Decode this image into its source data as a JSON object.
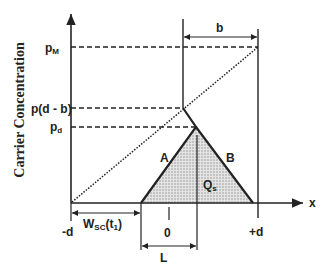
{
  "diagram": {
    "y_axis_label": "Carrier Concentration",
    "x_axis_label": "x",
    "y_ticks": {
      "pM": {
        "main": "p",
        "sub": "M"
      },
      "pdb": "p(d - b)",
      "pd": {
        "main": "p",
        "sub": "d"
      }
    },
    "x_ticks": {
      "neg_d": "-d",
      "zero": "0",
      "pos_d": "+d"
    },
    "dimensions": {
      "b": "b",
      "L": "L",
      "wsc": {
        "main": "W",
        "sub": "SC",
        "arg": "(t",
        "argsub": "1",
        "close": ")"
      }
    },
    "region_labels": {
      "A": "A",
      "B": "B",
      "Q": {
        "main": "Q",
        "sub": "s"
      }
    },
    "colors": {
      "line": "#222222",
      "fill": "#c8c8c8"
    }
  }
}
